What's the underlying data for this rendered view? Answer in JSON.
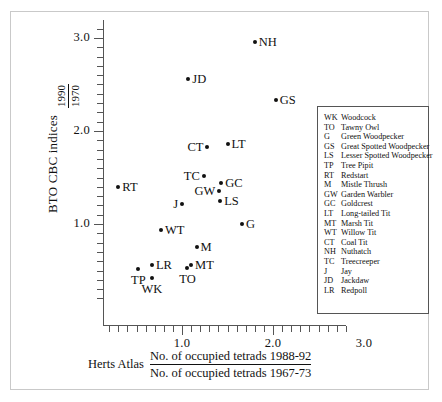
{
  "chart_data": {
    "type": "scatter",
    "title": "",
    "xlabel": "Herts Atlas No. of occupied tetrads 1988-92 / No. of occupied tetrads 1967-73",
    "ylabel": "BTO CBC indices 1990/1970",
    "xlim": [
      0.1,
      3.25
    ],
    "ylim": [
      0.15,
      3.15
    ],
    "xticks": [
      1.0,
      2.0,
      3.0
    ],
    "yticks": [
      1.0,
      2.0,
      3.0
    ],
    "xtick_labels": [
      "1.0",
      "2.0",
      "3.0"
    ],
    "ytick_labels": [
      "1.0",
      "2.0",
      "3.0"
    ],
    "grid": false,
    "legend_position": "right-inside",
    "points": [
      {
        "code": "NH",
        "name": "Nuthatch",
        "x": 1.8,
        "y": 2.96,
        "label_side": "right"
      },
      {
        "code": "JD",
        "name": "Jackdaw",
        "x": 1.07,
        "y": 2.56,
        "label_side": "right"
      },
      {
        "code": "GS",
        "name": "Great Spotted Woodpecker",
        "x": 2.03,
        "y": 2.33,
        "label_side": "right"
      },
      {
        "code": "LT",
        "name": "Long-tailed Tit",
        "x": 1.5,
        "y": 1.86,
        "label_side": "right"
      },
      {
        "code": "CT",
        "name": "Coal Tit",
        "x": 1.28,
        "y": 1.83,
        "label_side": "left"
      },
      {
        "code": "TC",
        "name": "Treecreeper",
        "x": 1.24,
        "y": 1.52,
        "label_side": "left"
      },
      {
        "code": "GC",
        "name": "Goldcrest",
        "x": 1.43,
        "y": 1.44,
        "label_side": "right"
      },
      {
        "code": "RT",
        "name": "Redstart",
        "x": 0.3,
        "y": 1.4,
        "label_side": "right"
      },
      {
        "code": "GW",
        "name": "Garden Warbler",
        "x": 1.41,
        "y": 1.36,
        "label_side": "left"
      },
      {
        "code": "LS",
        "name": "Lesser Spotted Woodpecker",
        "x": 1.42,
        "y": 1.25,
        "label_side": "right"
      },
      {
        "code": "J",
        "name": "Jay",
        "x": 1.0,
        "y": 1.21,
        "label_side": "left"
      },
      {
        "code": "G",
        "name": "Green Woodpecker",
        "x": 1.66,
        "y": 1.0,
        "label_side": "right"
      },
      {
        "code": "WT",
        "name": "Willow Tit",
        "x": 0.77,
        "y": 0.94,
        "label_side": "right"
      },
      {
        "code": "M",
        "name": "Mistle Thrush",
        "x": 1.16,
        "y": 0.75,
        "label_side": "right"
      },
      {
        "code": "MT",
        "name": "Marsh Tit",
        "x": 1.1,
        "y": 0.56,
        "label_side": "right"
      },
      {
        "code": "LR",
        "name": "Redpoll",
        "x": 0.67,
        "y": 0.56,
        "label_side": "right"
      },
      {
        "code": "TO",
        "name": "Tawny Owl",
        "x": 1.06,
        "y": 0.53,
        "label_side": "below"
      },
      {
        "code": "TP",
        "name": "Tree Pipit",
        "x": 0.52,
        "y": 0.52,
        "label_side": "below"
      },
      {
        "code": "WK",
        "name": "Woodcock",
        "x": 0.67,
        "y": 0.42,
        "label_side": "below"
      }
    ]
  },
  "axes": {
    "y_title": "BTO CBC indices",
    "y_fraction_numerator": "1990",
    "y_fraction_denominator": "1970",
    "x_prefix": "Herts Atlas",
    "x_fraction_numerator": "No. of occupied tetrads 1988-92",
    "x_fraction_denominator": "No. of occupied tetrads 1967-73"
  },
  "legend": {
    "entries": [
      {
        "code": "WK",
        "name": "Woodcock"
      },
      {
        "code": "TO",
        "name": "Tawny Owl"
      },
      {
        "code": "G",
        "name": "Green Woodpecker"
      },
      {
        "code": "GS",
        "name": "Great Spotted Woodpecker"
      },
      {
        "code": "LS",
        "name": "Lesser Spotted Woodpecker"
      },
      {
        "code": "TP",
        "name": "Tree Pipit"
      },
      {
        "code": "RT",
        "name": "Redstart"
      },
      {
        "code": "M",
        "name": "Mistle Thrush"
      },
      {
        "code": "GW",
        "name": "Garden Warbler"
      },
      {
        "code": "GC",
        "name": "Goldcrest"
      },
      {
        "code": "LT",
        "name": "Long-tailed Tit"
      },
      {
        "code": "MT",
        "name": "Marsh Tit"
      },
      {
        "code": "WT",
        "name": "Willow Tit"
      },
      {
        "code": "CT",
        "name": "Coal Tit"
      },
      {
        "code": "NH",
        "name": "Nuthatch"
      },
      {
        "code": "TC",
        "name": "Treecreeper"
      },
      {
        "code": "J",
        "name": "Jay"
      },
      {
        "code": "JD",
        "name": "Jackdaw"
      },
      {
        "code": "LR",
        "name": "Redpoll"
      }
    ]
  },
  "style": {
    "point_color": "#111111",
    "axis_color": "#555555",
    "frame_color": "#c9c9c9",
    "background": "#ffffff"
  }
}
